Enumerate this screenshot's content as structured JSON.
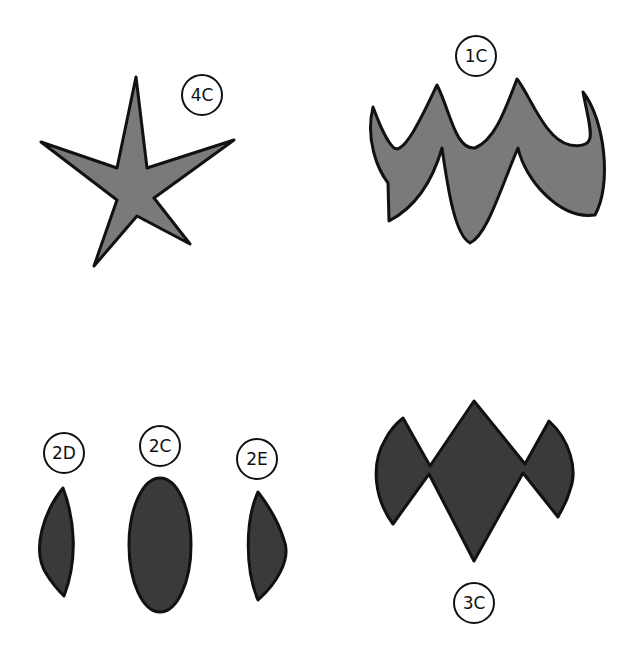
{
  "colors": {
    "light_fill": "#7a7a7a",
    "dark_fill": "#3a3a3a",
    "stroke": "#111111"
  },
  "shapes": [
    {
      "id": "4C",
      "label": "4C",
      "shape": "five-point star",
      "fill": "light"
    },
    {
      "id": "1C",
      "label": "1C",
      "shape": "scalloped crown",
      "fill": "light"
    },
    {
      "id": "2D",
      "label": "2D",
      "shape": "left half-lens",
      "fill": "dark"
    },
    {
      "id": "2C",
      "label": "2C",
      "shape": "ellipse",
      "fill": "dark"
    },
    {
      "id": "2E",
      "label": "2E",
      "shape": "right half-lens",
      "fill": "dark"
    },
    {
      "id": "3C",
      "label": "3C",
      "shape": "diamond with side wedges",
      "fill": "dark"
    }
  ]
}
